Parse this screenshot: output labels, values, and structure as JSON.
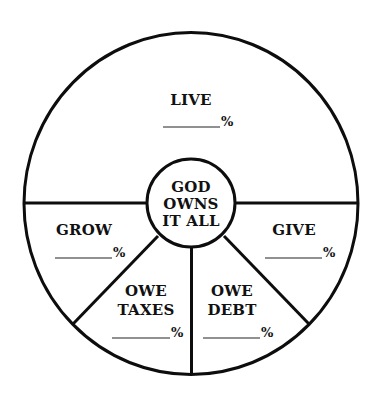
{
  "diagram": {
    "center": {
      "lines": [
        "GOD",
        "OWNS",
        "IT ALL"
      ]
    },
    "segments": [
      {
        "id": "live",
        "label_lines": [
          "LIVE"
        ],
        "value": "",
        "unit": "%"
      },
      {
        "id": "grow",
        "label_lines": [
          "GROW"
        ],
        "value": "",
        "unit": "%"
      },
      {
        "id": "give",
        "label_lines": [
          "GIVE"
        ],
        "value": "",
        "unit": "%"
      },
      {
        "id": "owe-taxes",
        "label_lines": [
          "OWE",
          "TAXES"
        ],
        "value": "",
        "unit": "%"
      },
      {
        "id": "owe-debt",
        "label_lines": [
          "OWE",
          "DEBT"
        ],
        "value": "",
        "unit": "%"
      }
    ],
    "colors": {
      "line": "#0d0d0d",
      "background": "#ffffff",
      "text": "#111111"
    }
  }
}
